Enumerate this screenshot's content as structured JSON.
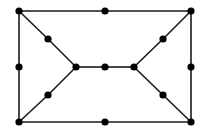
{
  "diagram": {
    "type": "graph",
    "background": "#ffffff",
    "edge_color": "#1a1a1a",
    "node_color": "#000000",
    "edge_width": 1.6,
    "node_radius": 3.6,
    "nodes": [
      {
        "id": "tl",
        "x": 19,
        "y": 11
      },
      {
        "id": "tm",
        "x": 105,
        "y": 11
      },
      {
        "id": "tr",
        "x": 191,
        "y": 11
      },
      {
        "id": "ml",
        "x": 19,
        "y": 67
      },
      {
        "id": "mr",
        "x": 191,
        "y": 67
      },
      {
        "id": "bl",
        "x": 19,
        "y": 122
      },
      {
        "id": "bm",
        "x": 105,
        "y": 122
      },
      {
        "id": "br",
        "x": 191,
        "y": 122
      },
      {
        "id": "dul",
        "x": 48,
        "y": 39
      },
      {
        "id": "dll",
        "x": 48,
        "y": 95
      },
      {
        "id": "cl",
        "x": 76,
        "y": 67
      },
      {
        "id": "cm",
        "x": 105,
        "y": 67
      },
      {
        "id": "cr",
        "x": 134,
        "y": 67
      },
      {
        "id": "dur",
        "x": 163,
        "y": 39
      },
      {
        "id": "dlr",
        "x": 163,
        "y": 95
      }
    ],
    "edges": [
      [
        "tl",
        "tm"
      ],
      [
        "tm",
        "tr"
      ],
      [
        "bl",
        "bm"
      ],
      [
        "bm",
        "br"
      ],
      [
        "tl",
        "ml"
      ],
      [
        "ml",
        "bl"
      ],
      [
        "tr",
        "mr"
      ],
      [
        "mr",
        "br"
      ],
      [
        "tl",
        "dul"
      ],
      [
        "dul",
        "cl"
      ],
      [
        "bl",
        "dll"
      ],
      [
        "dll",
        "cl"
      ],
      [
        "cl",
        "cm"
      ],
      [
        "cm",
        "cr"
      ],
      [
        "tr",
        "dur"
      ],
      [
        "dur",
        "cr"
      ],
      [
        "br",
        "dlr"
      ],
      [
        "dlr",
        "cr"
      ]
    ]
  }
}
